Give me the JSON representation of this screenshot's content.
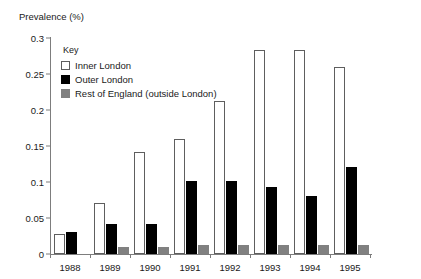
{
  "chart_data": {
    "type": "bar",
    "title": "",
    "ylabel": "Prevalence (%)",
    "xlabel": "",
    "ylim": [
      0,
      0.3
    ],
    "yticks": [
      "0",
      "0.05",
      "0.1",
      "0.15",
      "0.2",
      "0.25",
      "0.3"
    ],
    "ytick_values": [
      0,
      0.05,
      0.1,
      0.15,
      0.2,
      0.25,
      0.3
    ],
    "grid": false,
    "legend_position": "inside-upper-left",
    "legend_title": "Key",
    "categories": [
      "1988",
      "1989",
      "1990",
      "1991",
      "1992",
      "1993",
      "1994",
      "1995"
    ],
    "series": [
      {
        "name": "Inner London",
        "color": "#ffffff",
        "values": [
          0.028,
          0.071,
          0.141,
          0.16,
          0.212,
          0.283,
          0.283,
          0.26
        ]
      },
      {
        "name": "Outer London",
        "color": "#000000",
        "values": [
          0.03,
          0.041,
          0.041,
          0.101,
          0.101,
          0.093,
          0.081,
          0.121
        ]
      },
      {
        "name": "Rest of England (outside London)",
        "color": "#808080",
        "values": [
          0.0,
          0.01,
          0.01,
          0.012,
          0.012,
          0.012,
          0.012,
          0.012
        ]
      }
    ]
  },
  "axis": {
    "y_title": "Prevalence (%)"
  },
  "legend": {
    "title": "Key",
    "items": [
      {
        "label": "Inner London",
        "swatch": "inner"
      },
      {
        "label": "Outer London",
        "swatch": "outer"
      },
      {
        "label": "Rest of England (outside London)",
        "swatch": "rest"
      }
    ]
  },
  "colors": {
    "inner_london": "#ffffff",
    "outer_london": "#000000",
    "rest_of_england": "#808080",
    "axis": "#7d7d7d",
    "text": "#1a1a1a"
  }
}
